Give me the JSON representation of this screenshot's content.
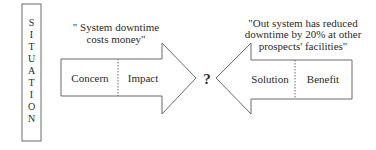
{
  "situation": {
    "label": "SITUATION",
    "letters": [
      "S",
      "I",
      "T",
      "U",
      "A",
      "T",
      "I",
      "O",
      "N"
    ]
  },
  "left_arrow": {
    "quote_lines": [
      "\" System downtime",
      "costs money\""
    ],
    "left_label": "Concern",
    "right_label": "Impact"
  },
  "center": {
    "symbol": "?"
  },
  "right_arrow": {
    "quote_lines": [
      "\"Out system has reduced",
      "downtime by 20% at other",
      "prospects' facilities\""
    ],
    "left_label": "Solution",
    "right_label": "Benefit"
  },
  "colors": {
    "stroke": "#6b6b6b",
    "text": "#2a2a2a",
    "background": "#ffffff"
  }
}
